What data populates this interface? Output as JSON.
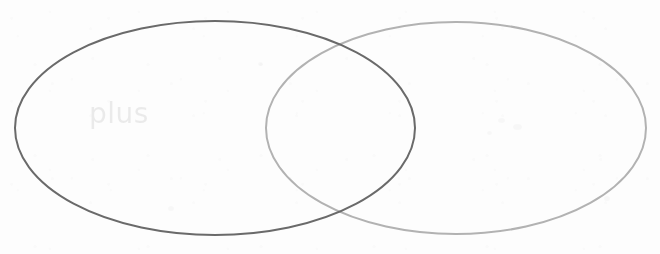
{
  "canvas": {
    "width": 660,
    "height": 254,
    "background_color": "#fdfdfd"
  },
  "diagram": {
    "type": "venn",
    "title": "",
    "set_count": 2,
    "labels": [
      {
        "text": "plus",
        "belongs_to": "left-set",
        "x": 89,
        "y": 99,
        "color": "#787878",
        "font_size": 28,
        "style": "dotted-halftone"
      }
    ],
    "sets": [
      {
        "id": "left-set",
        "name": "left-ellipse",
        "label": "plus",
        "stroke_color": "#6a6a6a",
        "stroke_width": 2,
        "fill": "none",
        "cx": 215,
        "cy": 128,
        "rx": 200,
        "ry": 107
      },
      {
        "id": "right-set",
        "name": "right-ellipse",
        "label": "",
        "stroke_color": "#b2b2b2",
        "stroke_width": 2,
        "fill": "none",
        "cx": 456,
        "cy": 128,
        "rx": 190,
        "ry": 106
      }
    ],
    "intersection": {
      "top_crossing": {
        "x": 335,
        "y": 48
      },
      "bottom_crossing": {
        "x": 340,
        "y": 210
      },
      "label": ""
    }
  },
  "chart_data": {
    "type": "venn",
    "title": "",
    "categories": [
      "plus",
      ""
    ],
    "values": [
      1,
      1
    ],
    "xlabel": "",
    "ylabel": "",
    "legend": [],
    "annotations": [
      "plus"
    ]
  }
}
